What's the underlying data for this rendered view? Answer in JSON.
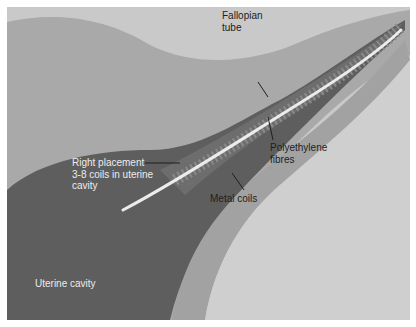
{
  "figure": {
    "colors": {
      "background_outer": "#c9c9c9",
      "tissue_mid": "#a9a9a9",
      "uterine_cavity": "#5e5e5e",
      "tube_wall": "#b4b4b4",
      "tube_lumen": "#6a6a6a",
      "device": "#ececec",
      "lower_right": "#cfcfcf",
      "muscle_band": "#a2a2a2"
    }
  },
  "labels": {
    "fallopian_tube": "Fallopian\ntube",
    "polyethylene_fibres": "Polyethylene\nfibres",
    "right_placement": "Right placement\n3-8 coils in uterine\ncavity",
    "metal_coils": "Metal coils",
    "uterine_cavity": "Uterine cavity"
  }
}
